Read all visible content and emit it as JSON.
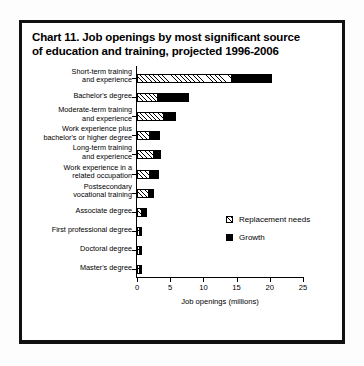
{
  "chart_data": {
    "type": "bar",
    "orientation": "horizontal",
    "stacked": true,
    "title": "Chart 11. Job openings by most significant source of education and training, projected 1996-2006",
    "title_lines": [
      "Chart 11. Job openings by most significant source",
      "of education and training, projected 1996-2006"
    ],
    "xlabel": "Job openings (millions)",
    "ylabel": "",
    "xlim": [
      0,
      25
    ],
    "xticks": [
      0,
      5,
      10,
      15,
      20,
      25
    ],
    "xticklabels": [
      "0",
      "5",
      "10",
      "15",
      "20",
      "25"
    ],
    "grid": false,
    "legend_position": "inside-right",
    "categories": [
      "Short-term training and experience",
      "Bachelor's degree",
      "Moderate-term training and experience",
      "Work experience plus bachelor's or higher degree",
      "Long-term training and experience",
      "Work experience in a related occupation",
      "Postsecondary vocational training",
      "Associate degree",
      "First professional degree",
      "Doctoral degree",
      "Master's degree"
    ],
    "category_lines": [
      [
        "Short-term training",
        "and experience"
      ],
      [
        "Bachelor's degree"
      ],
      [
        "Moderate-term training",
        "and experience"
      ],
      [
        "Work experience plus",
        "bachelor's or higher degree"
      ],
      [
        "Long-term training",
        "and experience"
      ],
      [
        "Work experience in a",
        "related occupation"
      ],
      [
        "Postsecondary",
        "vocational training"
      ],
      [
        "Associate degree"
      ],
      [
        "First professional degree"
      ],
      [
        "Doctoral degree"
      ],
      [
        "Master's degree"
      ]
    ],
    "series": [
      {
        "name": "Replacement needs",
        "fill": "hatched",
        "color": "#000000",
        "values": [
          14.3,
          3.1,
          4.1,
          2.0,
          2.5,
          2.0,
          1.8,
          0.8,
          0.3,
          0.3,
          0.3
        ]
      },
      {
        "name": "Growth",
        "fill": "solid",
        "color": "#000000",
        "values": [
          6.0,
          4.7,
          1.8,
          1.5,
          1.1,
          1.3,
          0.7,
          0.7,
          0.2,
          0.2,
          0.3
        ]
      }
    ],
    "totals": [
      20.3,
      7.8,
      5.9,
      3.5,
      3.6,
      3.3,
      2.5,
      1.5,
      0.5,
      0.5,
      0.6
    ]
  },
  "legend": {
    "items": [
      {
        "label": "Replacement needs",
        "swatch": "hatched"
      },
      {
        "label": "Growth",
        "swatch": "solid"
      }
    ]
  },
  "colors": {
    "ink": "#000000",
    "paper": "#ffffff",
    "frame": "#111111"
  }
}
